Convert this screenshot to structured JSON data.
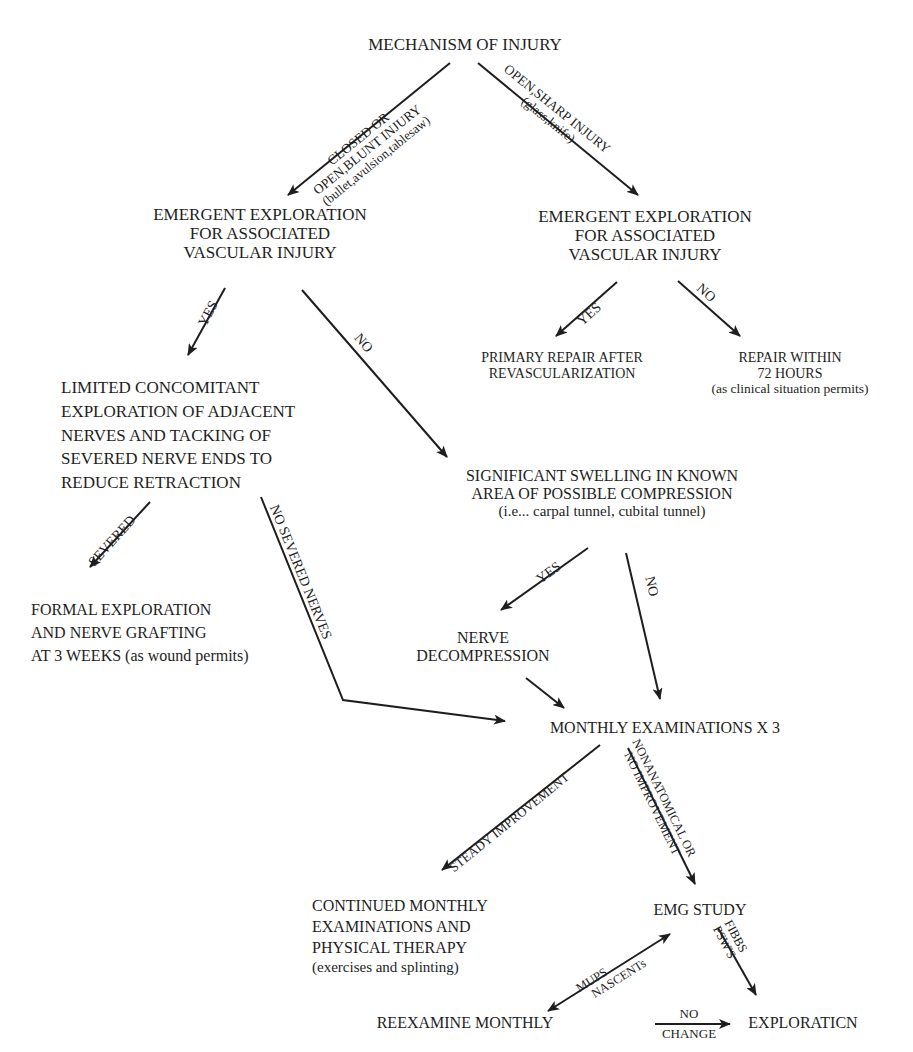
{
  "diagram": {
    "type": "flowchart",
    "title": "MECHANISM OF INJURY",
    "nodes": {
      "mechanism": {
        "lines": [
          "MECHANISM OF INJURY"
        ]
      },
      "emergent_left": {
        "lines": [
          "EMERGENT EXPLORATION",
          "FOR ASSOCIATED",
          "VASCULAR INJURY"
        ]
      },
      "emergent_right": {
        "lines": [
          "EMERGENT EXPLORATION",
          "FOR ASSOCIATED",
          "VASCULAR INJURY"
        ]
      },
      "primary_repair": {
        "lines": [
          "PRIMARY REPAIR AFTER",
          "REVASCULARIZATION"
        ]
      },
      "repair_72": {
        "lines": [
          "REPAIR WITHIN",
          "72 HOURS"
        ],
        "note": "(as clinical situation permits)"
      },
      "limited_exploration": {
        "lines": [
          "LIMITED CONCOMITANT",
          "EXPLORATION OF ADJACENT",
          "NERVES AND TACKING OF",
          "SEVERED NERVE ENDS TO",
          "REDUCE RETRACTION"
        ]
      },
      "significant_swelling": {
        "lines": [
          "SIGNIFICANT SWELLING IN KNOWN",
          "AREA OF POSSIBLE COMPRESSION"
        ],
        "note": "(i.e... carpal tunnel, cubital tunnel)"
      },
      "formal_exploration": {
        "lines": [
          "FORMAL EXPLORATION",
          "AND NERVE GRAFTING",
          "AT 3 WEEKS (as wound permits)"
        ]
      },
      "nerve_decompression": {
        "lines": [
          "NERVE",
          "DECOMPRESSION"
        ]
      },
      "monthly_exams": {
        "lines": [
          "MONTHLY EXAMINATIONS X 3"
        ]
      },
      "continued_monthly": {
        "lines": [
          "CONTINUED MONTHLY",
          "EXAMINATIONS AND",
          "PHYSICAL THERAPY"
        ],
        "note": "(exercises and splinting)"
      },
      "emg_study": {
        "lines": [
          "EMG STUDY"
        ]
      },
      "reexamine_monthly": {
        "lines": [
          "REEXAMINE MONTHLY"
        ]
      },
      "exploration": {
        "lines": [
          "EXPLORATICN"
        ]
      }
    },
    "edges": [
      {
        "from": "mechanism",
        "to": "emergent_left",
        "label_lines": [
          "CLOSED OR",
          "OPEN,BLUNT INJURY",
          "(bullet,avulsion,tablesaw)"
        ]
      },
      {
        "from": "mechanism",
        "to": "emergent_right",
        "label_lines": [
          "OPEN,SHARP INJURY",
          "(glass,knife)"
        ]
      },
      {
        "from": "emergent_left",
        "to": "limited_exploration",
        "label_lines": [
          "YES"
        ]
      },
      {
        "from": "emergent_left",
        "to": "significant_swelling",
        "label_lines": [
          "NO"
        ]
      },
      {
        "from": "emergent_right",
        "to": "primary_repair",
        "label_lines": [
          "YES"
        ]
      },
      {
        "from": "emergent_right",
        "to": "repair_72",
        "label_lines": [
          "NO"
        ]
      },
      {
        "from": "limited_exploration",
        "to": "formal_exploration",
        "label_lines": [
          "SEVERED"
        ]
      },
      {
        "from": "limited_exploration",
        "to": "monthly_exams",
        "label_lines": [
          "NO SEVERED NERVES"
        ]
      },
      {
        "from": "significant_swelling",
        "to": "nerve_decompression",
        "label_lines": [
          "YES"
        ]
      },
      {
        "from": "significant_swelling",
        "to": "monthly_exams",
        "label_lines": [
          "NO"
        ]
      },
      {
        "from": "nerve_decompression",
        "to": "monthly_exams",
        "label_lines": []
      },
      {
        "from": "monthly_exams",
        "to": "continued_monthly",
        "label_lines": [
          "STEADY IMPROVEMENT"
        ]
      },
      {
        "from": "monthly_exams",
        "to": "emg_study",
        "label_lines": [
          "NONANATOMICAL OR",
          "NO IMPROVEMENT"
        ]
      },
      {
        "from": "emg_study",
        "to": "reexamine_monthly",
        "label_lines": [
          "MUPS",
          "NASCENTs"
        ],
        "bidirectional": true
      },
      {
        "from": "emg_study",
        "to": "exploration",
        "label_lines": [
          "FIBBS",
          "PSW'S"
        ]
      },
      {
        "from": "reexamine_monthly",
        "to": "exploration",
        "label_lines": [
          "NO",
          "CHANGE"
        ]
      }
    ],
    "colors": {
      "ink": "#1e1e1e",
      "background": "#ffffff"
    }
  }
}
